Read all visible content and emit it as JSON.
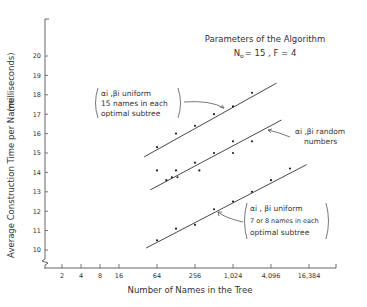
{
  "chart_data": {
    "type": "scatter",
    "title": "Parameters of the Algorithm",
    "subtitle": "N0 = 15 , F = 4",
    "xlabel": "Number of Names in the Tree",
    "ylabel": "Average Construction Time per Name (milliseconds)",
    "x_scale": "log2",
    "x_ticks": [
      "2",
      "4",
      "8",
      "16",
      "64",
      "256",
      "1,024",
      "4,096",
      "16,384"
    ],
    "y_ticks": [
      "10",
      "11",
      "12",
      "13",
      "14",
      "15",
      "16",
      "17",
      "18",
      "19",
      "20"
    ],
    "ylim": [
      9.4,
      21.9
    ],
    "grid": false,
    "legend": "inline annotations",
    "series": [
      {
        "name": "αi, βi uniform — 15 names in each optimal subtree",
        "points": [
          [
            64,
            15.3
          ],
          [
            128,
            16.0
          ],
          [
            256,
            16.4
          ],
          [
            512,
            17.0
          ],
          [
            1024,
            17.4
          ],
          [
            2048,
            18.1
          ]
        ],
        "fit_line": [
          [
            40,
            14.8
          ],
          [
            5000,
            18.6
          ]
        ]
      },
      {
        "name": "αi, βi random numbers",
        "points": [
          [
            64,
            14.1
          ],
          [
            90,
            13.6
          ],
          [
            128,
            14.1
          ],
          [
            110,
            13.75
          ],
          [
            135,
            13.75
          ],
          [
            256,
            14.5
          ],
          [
            300,
            14.1
          ],
          [
            512,
            15.0
          ],
          [
            1024,
            15.0
          ],
          [
            1024,
            15.6
          ],
          [
            2048,
            15.6
          ]
        ],
        "fit_line": [
          [
            50,
            13.1
          ],
          [
            6000,
            16.7
          ]
        ]
      },
      {
        "name": "αi, βi uniform — 7 or 8 names in each optimal subtree",
        "points": [
          [
            64,
            10.5
          ],
          [
            128,
            11.1
          ],
          [
            256,
            11.3
          ],
          [
            512,
            12.1
          ],
          [
            1024,
            12.5
          ],
          [
            2048,
            13.0
          ],
          [
            4096,
            13.6
          ],
          [
            8192,
            14.2
          ]
        ],
        "fit_line": [
          [
            43,
            10.1
          ],
          [
            15000,
            14.4
          ]
        ]
      }
    ]
  },
  "labels": {
    "title_line1": "Parameters of the Algorithm",
    "title_n": "N",
    "title_sub": "o",
    "title_rest": "= 15   ,   F = 4",
    "ylabel_main": "Average Construction Time per Name",
    "ylabel_unit": "(milliseconds)",
    "xlabel": "Number of Names in the Tree",
    "anno_top_1": "αi ,βi uniform",
    "anno_top_2": "15 names in each",
    "anno_top_3": "optimal subtree",
    "anno_mid_1": "αi ,βi random",
    "anno_mid_2": "numbers",
    "anno_bot_1": "αi , βi uniform",
    "anno_bot_2": "7 or 8 names in each",
    "anno_bot_3": "optimal subtree"
  }
}
